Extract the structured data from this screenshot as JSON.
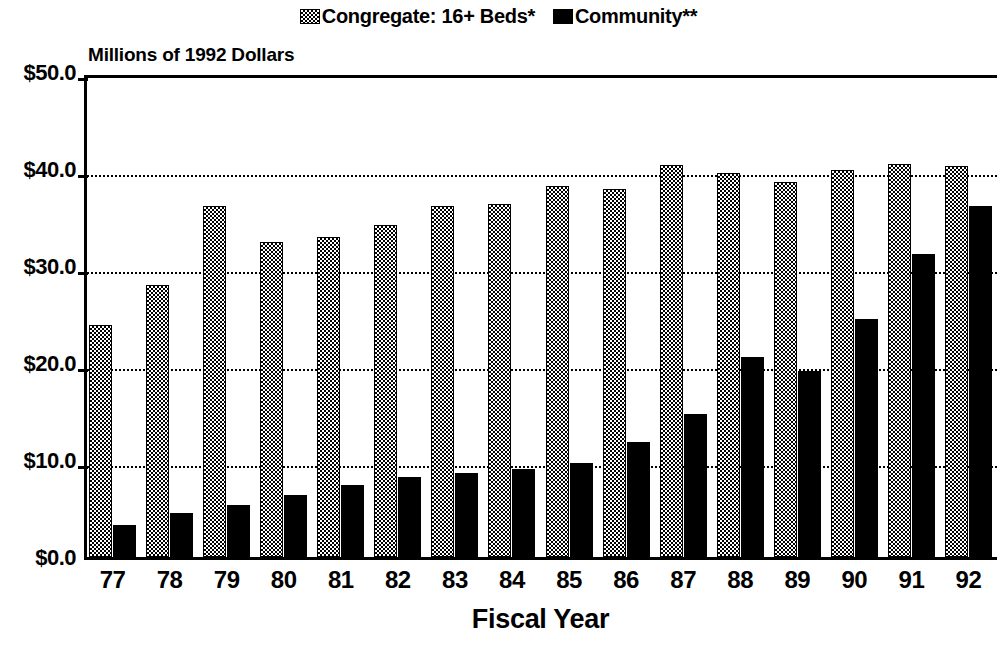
{
  "chart_data": {
    "type": "bar",
    "title": "",
    "subtitle": "",
    "ylabel": "Millions of 1992 Dollars",
    "xlabel": "Fiscal Year",
    "ylim": [
      0,
      50
    ],
    "yticks": [
      0,
      10,
      20,
      30,
      40,
      50
    ],
    "ytick_labels": [
      "$0.0",
      "$10.0",
      "$20.0",
      "$30.0",
      "$40.0",
      "$50.0"
    ],
    "grid": "horizontal-dotted",
    "legend_position": "top-center",
    "categories": [
      "77",
      "78",
      "79",
      "80",
      "81",
      "82",
      "83",
      "84",
      "85",
      "86",
      "87",
      "88",
      "89",
      "90",
      "91",
      "92"
    ],
    "series": [
      {
        "name": "Congregate: 16+ Beds*",
        "fill": "checkered",
        "color": "#000000",
        "values": [
          23.9,
          28.0,
          36.2,
          32.5,
          33.0,
          34.2,
          36.2,
          36.4,
          38.3,
          37.9,
          40.4,
          39.6,
          38.7,
          39.9,
          40.5,
          40.3
        ]
      },
      {
        "name": "Community**",
        "fill": "solid",
        "color": "#000000",
        "values": [
          3.3,
          4.5,
          5.4,
          6.4,
          7.4,
          8.2,
          8.7,
          9.1,
          9.7,
          11.9,
          14.7,
          20.6,
          19.2,
          24.5,
          31.2,
          36.2
        ]
      }
    ]
  },
  "legend": {
    "entries": [
      {
        "label": "Congregate: 16+ Beds*",
        "swatch": "checkered-pattern-swatch"
      },
      {
        "label": "Community**",
        "swatch": "solid-black-swatch"
      }
    ]
  },
  "axes": {
    "y_title": "Millions of 1992 Dollars",
    "x_title": "Fiscal Year"
  }
}
